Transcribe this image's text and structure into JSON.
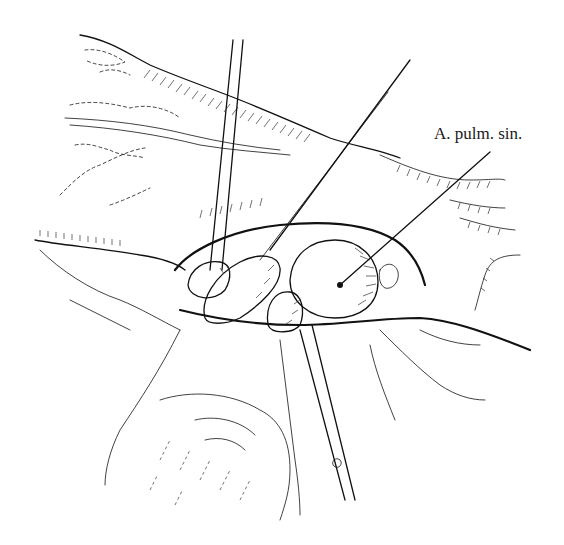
{
  "figure": {
    "type": "surgical-illustration",
    "labels": [
      {
        "text": "A. pulm. sin.",
        "target": "left-pulmonary-artery"
      }
    ]
  }
}
